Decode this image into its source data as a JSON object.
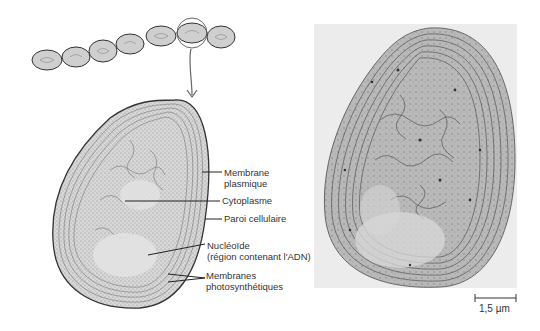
{
  "figure": {
    "filament_cell_count": 7,
    "highlighted_cell_index": 5,
    "labels": [
      {
        "id": "membrane-plasmique",
        "line1": "Membrane",
        "line2": "plasmique"
      },
      {
        "id": "cytoplasme",
        "line1": "Cytoplasme",
        "line2": ""
      },
      {
        "id": "paroi-cellulaire",
        "line1": "Paroi cellulaire",
        "line2": ""
      },
      {
        "id": "nucleoide",
        "line1": "Nucléoïde",
        "line2": "(région contenant l'ADN)"
      },
      {
        "id": "membranes-photosynthetiques",
        "line1": "Membranes",
        "line2": "photosynthétiques"
      }
    ],
    "scale_bar": {
      "label": "1,5 µm"
    },
    "colors": {
      "ink": "#333333",
      "cell_fill": "#cfcfcf",
      "micrograph_bg": "#e6e6e6"
    }
  }
}
